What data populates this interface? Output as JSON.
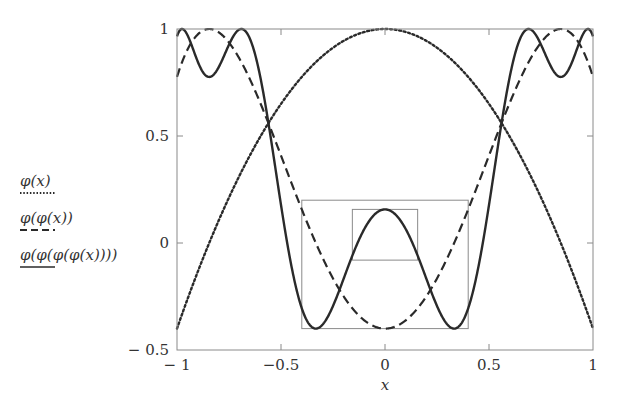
{
  "chart_data": {
    "type": "line",
    "title": "",
    "xlabel": "x",
    "ylabel": "",
    "xlim": [
      -1,
      1
    ],
    "ylim": [
      -0.5,
      1
    ],
    "grid": false,
    "legend_position": "left",
    "x_ticks": [
      -1,
      -0.5,
      0,
      0.5,
      1
    ],
    "x_tick_labels": [
      "− 1",
      "−0.5",
      "0",
      "0.5",
      "1"
    ],
    "y_ticks": [
      -0.5,
      0,
      0.5,
      1
    ],
    "y_tick_labels": [
      "− 0.5",
      "0",
      "0.5",
      "1"
    ],
    "function": "phi(x) = 1 - 1.4 x^2",
    "mu": 1.4,
    "series": [
      {
        "name": "φ(x)",
        "style": "dotted",
        "iterations": 1
      },
      {
        "name": "φ(φ(x))",
        "style": "dashed",
        "iterations": 2
      },
      {
        "name": "φ(φ(φ(φ(x))))",
        "style": "solid",
        "iterations": 4
      }
    ],
    "sample_points": {
      "x": [
        -1,
        -0.75,
        -0.5,
        -0.25,
        0,
        0.25,
        0.5,
        0.75,
        1
      ],
      "phi1": [
        -0.4,
        0.2125,
        0.65,
        0.9125,
        1,
        0.9125,
        0.65,
        0.2125,
        -0.4
      ],
      "phi2": [
        0.776,
        0.937,
        0.409,
        -0.166,
        -0.4,
        -0.166,
        0.409,
        0.937,
        0.776
      ],
      "phi4": [
        0.957,
        0.985,
        0.545,
        -0.398,
        0.157,
        -0.398,
        0.545,
        0.985,
        0.957
      ]
    },
    "annotations": [
      {
        "type": "box",
        "label": "outer-renormalization-box",
        "x": [
          -0.4,
          0.4
        ],
        "y": [
          -0.4,
          0.2
        ]
      },
      {
        "type": "box",
        "label": "inner-renormalization-box",
        "x": [
          -0.157,
          0.157
        ],
        "y": [
          -0.08,
          0.157
        ]
      }
    ]
  },
  "legend": [
    {
      "label": "φ(x)",
      "style": "dotted"
    },
    {
      "label": "φ(φ(x))",
      "style": "dashed"
    },
    {
      "label": "φ(φ(φ(φ(x))))",
      "style": "solid"
    }
  ],
  "axis": {
    "xlabel": "x"
  },
  "colors": {
    "frame": "#888888",
    "curve": "#2a2a2a",
    "box": "#8a8a8a"
  }
}
